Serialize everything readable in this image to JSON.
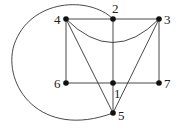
{
  "diagram": {
    "type": "graph",
    "nodes": [
      {
        "id": "1",
        "label": "1",
        "x": 113,
        "y": 83,
        "lx": 114,
        "ly": 98
      },
      {
        "id": "2",
        "label": "2",
        "x": 113,
        "y": 19,
        "lx": 112,
        "ly": 13
      },
      {
        "id": "3",
        "label": "3",
        "x": 159,
        "y": 19,
        "lx": 164,
        "ly": 24
      },
      {
        "id": "4",
        "label": "4",
        "x": 66,
        "y": 19,
        "lx": 54,
        "ly": 24
      },
      {
        "id": "5",
        "label": "5",
        "x": 113,
        "y": 113,
        "lx": 118,
        "ly": 120
      },
      {
        "id": "6",
        "label": "6",
        "x": 66,
        "y": 83,
        "lx": 54,
        "ly": 88
      },
      {
        "id": "7",
        "label": "7",
        "x": 159,
        "y": 83,
        "lx": 164,
        "ly": 88
      }
    ],
    "edges": [
      {
        "from": "4",
        "to": "2",
        "shape": "line"
      },
      {
        "from": "2",
        "to": "3",
        "shape": "line"
      },
      {
        "from": "4",
        "to": "6",
        "shape": "line"
      },
      {
        "from": "3",
        "to": "7",
        "shape": "line"
      },
      {
        "from": "2",
        "to": "1",
        "shape": "line"
      },
      {
        "from": "1",
        "to": "5",
        "shape": "line"
      },
      {
        "from": "6",
        "to": "1",
        "shape": "line"
      },
      {
        "from": "1",
        "to": "7",
        "shape": "line"
      },
      {
        "from": "4",
        "to": "5",
        "shape": "line"
      },
      {
        "from": "3",
        "to": "5",
        "shape": "line"
      },
      {
        "from": "4",
        "to": "3",
        "shape": "curve-below"
      },
      {
        "from": "2",
        "to": "5",
        "shape": "arc-left"
      }
    ]
  }
}
